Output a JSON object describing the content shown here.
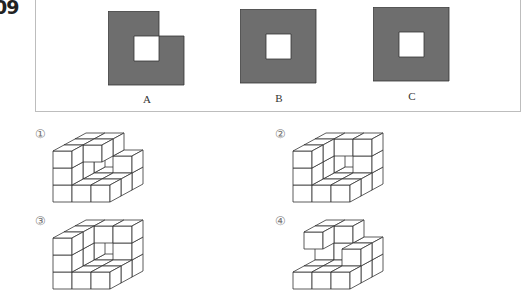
{
  "question": {
    "number": "09"
  },
  "shapes": [
    {
      "label": "A",
      "type": "L-notch",
      "fill": "#6e6e6e"
    },
    {
      "label": "B",
      "type": "square-hole",
      "fill": "#6e6e6e"
    },
    {
      "label": "C",
      "type": "square-hole",
      "fill": "#6e6e6e"
    }
  ],
  "options": [
    {
      "num": "①",
      "cubes": [
        [
          0,
          0,
          0
        ],
        [
          1,
          0,
          0
        ],
        [
          2,
          0,
          0
        ],
        [
          0,
          0,
          1
        ],
        [
          0,
          0,
          2
        ],
        [
          0,
          1,
          0
        ],
        [
          0,
          1,
          1
        ],
        [
          0,
          1,
          2
        ],
        [
          1,
          1,
          2
        ],
        [
          0,
          2,
          0
        ],
        [
          0,
          2,
          1
        ],
        [
          0,
          2,
          2
        ],
        [
          1,
          2,
          2
        ],
        [
          2,
          1,
          0
        ],
        [
          2,
          2,
          0
        ],
        [
          2,
          2,
          1
        ],
        [
          1,
          1,
          0
        ],
        [
          1,
          2,
          0
        ]
      ]
    },
    {
      "num": "②",
      "cubes": [
        [
          0,
          0,
          0
        ],
        [
          1,
          0,
          0
        ],
        [
          2,
          0,
          0
        ],
        [
          0,
          0,
          1
        ],
        [
          0,
          0,
          2
        ],
        [
          0,
          1,
          0
        ],
        [
          0,
          1,
          1
        ],
        [
          0,
          1,
          2
        ],
        [
          0,
          2,
          0
        ],
        [
          0,
          2,
          1
        ],
        [
          0,
          2,
          2
        ],
        [
          1,
          2,
          2
        ],
        [
          1,
          1,
          0
        ],
        [
          1,
          2,
          0
        ],
        [
          2,
          1,
          0
        ],
        [
          2,
          2,
          0
        ],
        [
          2,
          2,
          1
        ],
        [
          2,
          2,
          2
        ]
      ]
    },
    {
      "num": "③",
      "cubes": [
        [
          0,
          0,
          0
        ],
        [
          1,
          0,
          0
        ],
        [
          2,
          0,
          0
        ],
        [
          0,
          0,
          1
        ],
        [
          0,
          0,
          2
        ],
        [
          0,
          1,
          0
        ],
        [
          0,
          1,
          1
        ],
        [
          0,
          1,
          2
        ],
        [
          0,
          2,
          0
        ],
        [
          0,
          2,
          1
        ],
        [
          0,
          2,
          2
        ],
        [
          1,
          2,
          2
        ],
        [
          1,
          1,
          0
        ],
        [
          1,
          2,
          0
        ],
        [
          2,
          1,
          0
        ],
        [
          2,
          2,
          0
        ],
        [
          2,
          2,
          1
        ],
        [
          2,
          2,
          2
        ]
      ]
    },
    {
      "num": "④",
      "cubes": [
        [
          0,
          0,
          0
        ],
        [
          1,
          0,
          0
        ],
        [
          2,
          0,
          0
        ],
        [
          0,
          1,
          2
        ],
        [
          0,
          2,
          2
        ],
        [
          1,
          2,
          2
        ],
        [
          0,
          1,
          0
        ],
        [
          0,
          2,
          0
        ],
        [
          0,
          2,
          1
        ],
        [
          1,
          1,
          0
        ],
        [
          1,
          2,
          0
        ],
        [
          2,
          1,
          0
        ],
        [
          2,
          2,
          0
        ],
        [
          2,
          1,
          1
        ],
        [
          2,
          2,
          1
        ],
        [
          1,
          2,
          1
        ]
      ]
    }
  ]
}
